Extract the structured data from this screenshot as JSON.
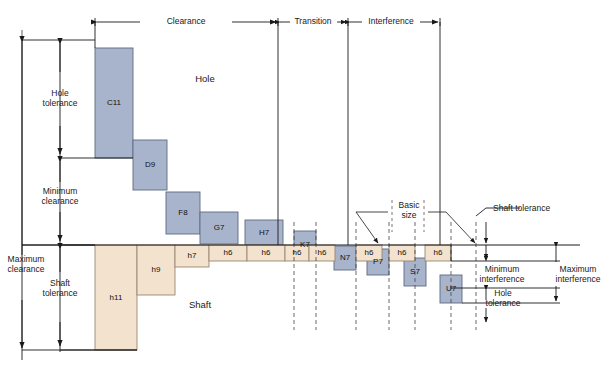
{
  "diagram": {
    "region_labels": {
      "clearance": "Clearance",
      "transition": "Transition",
      "interference": "Interference"
    },
    "area_labels": {
      "hole": "Hole",
      "shaft": "Shaft"
    },
    "left_dimensions": [
      {
        "id": "hole-tolerance",
        "text": "Hole\ntolerance"
      },
      {
        "id": "minimum-clearance",
        "text": "Minimum\nclearance"
      },
      {
        "id": "maximum-clearance",
        "text": "Maximum\nclearance"
      },
      {
        "id": "shaft-tolerance",
        "text": "Shaft\ntolerance"
      }
    ],
    "right_dimensions": [
      {
        "id": "shaft-tolerance-right",
        "text": "Shaft tolerance"
      },
      {
        "id": "minimum-interference",
        "text": "Minimum\ninterference"
      },
      {
        "id": "hole-tolerance-right",
        "text": "Hole\ntolerance"
      },
      {
        "id": "maximum-interference",
        "text": "Maximum\ninterference"
      }
    ],
    "basic_size_label": "Basic\nsize",
    "colors": {
      "hole_fill": "#a8b4cc",
      "hole_stroke": "#5e6a80",
      "shaft_fill": "#f3e2cd",
      "shaft_stroke": "#9a8670",
      "line": "#1a1a1a",
      "dashed": "#444444",
      "background": "#ffffff"
    },
    "zero_line_y": 245,
    "hole_zones": [
      {
        "label": "C11",
        "x": 95,
        "y": 48,
        "w": 38,
        "h": 110,
        "type": "hole"
      },
      {
        "label": "D9",
        "x": 133,
        "y": 140,
        "w": 34,
        "h": 50,
        "type": "hole"
      },
      {
        "label": "F8",
        "x": 166,
        "y": 192,
        "w": 34,
        "h": 42,
        "type": "hole"
      },
      {
        "label": "G7",
        "x": 200,
        "y": 212,
        "w": 38,
        "h": 32,
        "type": "hole"
      },
      {
        "label": "H7",
        "x": 245,
        "y": 220,
        "w": 38,
        "h": 25,
        "type": "hole"
      },
      {
        "label": "K7",
        "x": 294,
        "y": 231,
        "w": 22,
        "h": 28,
        "type": "hole"
      },
      {
        "label": "N7",
        "x": 334,
        "y": 246,
        "w": 22,
        "h": 24,
        "type": "hole"
      },
      {
        "label": "P7",
        "x": 367,
        "y": 249,
        "w": 22,
        "h": 26,
        "type": "hole"
      },
      {
        "label": "S7",
        "x": 404,
        "y": 258,
        "w": 22,
        "h": 28,
        "type": "hole"
      },
      {
        "label": "U7",
        "x": 440,
        "y": 275,
        "w": 22,
        "h": 28,
        "type": "hole"
      }
    ],
    "shaft_zones": [
      {
        "label": "h11",
        "x": 95,
        "y": 245,
        "w": 42,
        "h": 105,
        "type": "shaft"
      },
      {
        "label": "h9",
        "x": 137,
        "y": 245,
        "w": 38,
        "h": 50,
        "type": "shaft"
      },
      {
        "label": "h7",
        "x": 175,
        "y": 245,
        "w": 34,
        "h": 22,
        "type": "shaft"
      },
      {
        "label": "h6",
        "x": 209,
        "y": 245,
        "w": 38,
        "h": 16,
        "type": "shaft"
      },
      {
        "label": "h6",
        "x": 247,
        "y": 245,
        "w": 38,
        "h": 16,
        "type": "shaft"
      },
      {
        "label": "h6",
        "x": 285,
        "y": 245,
        "w": 24,
        "h": 16,
        "type": "shaft"
      },
      {
        "label": "h6",
        "x": 309,
        "y": 245,
        "w": 26,
        "h": 16,
        "type": "shaft"
      },
      {
        "label": "h6",
        "x": 356,
        "y": 245,
        "w": 26,
        "h": 16,
        "type": "shaft"
      },
      {
        "label": "h6",
        "x": 389,
        "y": 245,
        "w": 26,
        "h": 16,
        "type": "shaft"
      },
      {
        "label": "h6",
        "x": 425,
        "y": 245,
        "w": 26,
        "h": 16,
        "type": "shaft"
      }
    ]
  }
}
